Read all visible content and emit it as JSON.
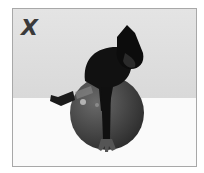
{
  "image": {
    "description": "Exercise illustration: person lying prone over an exercise ball, one leg extended back, one hand on the floor",
    "mark": {
      "text": "X",
      "meaning": "incorrect form indicator"
    },
    "colors": {
      "wall": "#dcdcdc",
      "floor": "#fafafa",
      "ball": "#4a4a4a",
      "figure": "#111111",
      "border": "#a8a8a8",
      "mark": "#3a3a3a"
    }
  }
}
